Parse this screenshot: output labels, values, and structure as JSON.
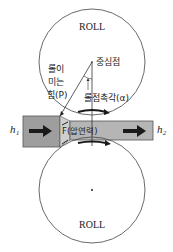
{
  "diagram": {
    "type": "rolling-process",
    "top_roll": {
      "label": "ROLL",
      "center_label": "중심점"
    },
    "bottom_roll": {
      "label": "ROLL"
    },
    "labels": {
      "roll_force_line1": "롤이",
      "roll_force_line2": "미는",
      "roll_force_line3": "힘(P)",
      "contact_angle": "롤접촉각(α)",
      "pressure": "F(압연력)",
      "h1": "h₁",
      "h2": "h₂"
    },
    "colors": {
      "strip_thick": "#9e9e9e",
      "strip_taper": "#c8c8c8",
      "strip_thin": "#b4b4b4",
      "line": "#333333",
      "arrow": "#1a1a1a"
    }
  }
}
